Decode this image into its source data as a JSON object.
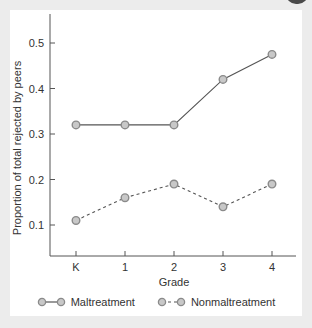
{
  "chart_data": {
    "type": "line",
    "title": "",
    "xlabel": "Grade",
    "ylabel": "Proportion of total rejected by peers",
    "categories": [
      "K",
      "1",
      "2",
      "3",
      "4"
    ],
    "y_ticks": [
      0.1,
      0.2,
      0.3,
      0.4,
      0.5
    ],
    "y_tick_labels": [
      "0.1",
      "0.2",
      "0.3",
      "0.4",
      "0.5"
    ],
    "ylim": [
      0.04,
      0.56
    ],
    "grid": false,
    "legend_position": "bottom",
    "series": [
      {
        "name": "Maltreatment",
        "line_style": "solid",
        "values": [
          0.32,
          0.32,
          0.32,
          0.42,
          0.475
        ]
      },
      {
        "name": "Nonmaltreatment",
        "line_style": "dashed",
        "values": [
          0.11,
          0.16,
          0.19,
          0.14,
          0.19
        ]
      }
    ],
    "colors": {
      "line": "#555555",
      "marker_fill": "#c8c8c8",
      "marker_stroke": "#8a8a8a"
    }
  },
  "legend": {
    "items": [
      {
        "label": "Maltreatment"
      },
      {
        "label": "Nonmaltreatment"
      }
    ]
  }
}
